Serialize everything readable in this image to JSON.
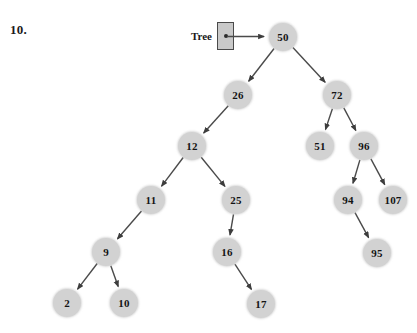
{
  "exercise": {
    "number_label": "10."
  },
  "pointer": {
    "label": "Tree",
    "icon": "pointer-dot-icon",
    "arrow_icon": "arrow-right-icon",
    "target_node": "50"
  },
  "diagram": {
    "type": "binary-search-tree",
    "node_fill_color": "#d2d2d2",
    "edge_color": "#4a4a4a",
    "text_color": "#141414",
    "nodes": [
      {
        "id": "n50",
        "value": "50",
        "x": 283,
        "y": 37,
        "depth": 0
      },
      {
        "id": "n26",
        "value": "26",
        "x": 238,
        "y": 95,
        "depth": 1
      },
      {
        "id": "n72",
        "value": "72",
        "x": 337,
        "y": 95,
        "depth": 1
      },
      {
        "id": "n12",
        "value": "12",
        "x": 192,
        "y": 146,
        "depth": 2
      },
      {
        "id": "n51",
        "value": "51",
        "x": 320,
        "y": 146,
        "depth": 2
      },
      {
        "id": "n96",
        "value": "96",
        "x": 364,
        "y": 146,
        "depth": 2
      },
      {
        "id": "n11",
        "value": "11",
        "x": 151,
        "y": 200,
        "depth": 3
      },
      {
        "id": "n25",
        "value": "25",
        "x": 236,
        "y": 200,
        "depth": 3
      },
      {
        "id": "n94",
        "value": "94",
        "x": 348,
        "y": 200,
        "depth": 3
      },
      {
        "id": "n107",
        "value": "107",
        "x": 393,
        "y": 200,
        "depth": 3
      },
      {
        "id": "n9",
        "value": "9",
        "x": 106,
        "y": 252,
        "depth": 4
      },
      {
        "id": "n16",
        "value": "16",
        "x": 227,
        "y": 252,
        "depth": 4
      },
      {
        "id": "n95",
        "value": "95",
        "x": 377,
        "y": 253,
        "depth": 4
      },
      {
        "id": "n2",
        "value": "2",
        "x": 67,
        "y": 303,
        "depth": 5
      },
      {
        "id": "n10",
        "value": "10",
        "x": 124,
        "y": 303,
        "depth": 5
      },
      {
        "id": "n17",
        "value": "17",
        "x": 261,
        "y": 304,
        "depth": 5
      }
    ],
    "edges": [
      {
        "from": "n50",
        "to": "n26",
        "side": "left"
      },
      {
        "from": "n50",
        "to": "n72",
        "side": "right"
      },
      {
        "from": "n26",
        "to": "n12",
        "side": "left"
      },
      {
        "from": "n12",
        "to": "n11",
        "side": "left"
      },
      {
        "from": "n12",
        "to": "n25",
        "side": "right"
      },
      {
        "from": "n11",
        "to": "n9",
        "side": "left"
      },
      {
        "from": "n9",
        "to": "n2",
        "side": "left"
      },
      {
        "from": "n9",
        "to": "n10",
        "side": "right"
      },
      {
        "from": "n25",
        "to": "n16",
        "side": "left"
      },
      {
        "from": "n16",
        "to": "n17",
        "side": "right"
      },
      {
        "from": "n72",
        "to": "n51",
        "side": "left"
      },
      {
        "from": "n72",
        "to": "n96",
        "side": "right"
      },
      {
        "from": "n96",
        "to": "n94",
        "side": "left"
      },
      {
        "from": "n96",
        "to": "n107",
        "side": "right"
      },
      {
        "from": "n94",
        "to": "n95",
        "side": "right"
      }
    ]
  }
}
